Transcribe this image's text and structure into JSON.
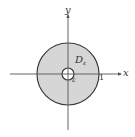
{
  "figure": {
    "type": "annulus-diagram",
    "axes": {
      "x_label": "x",
      "y_label": "y"
    },
    "region": {
      "label_main": "D",
      "label_sub": "ε",
      "fill_color": "#d6d6d6",
      "stroke_color": "#3a3a3a"
    },
    "radii": {
      "outer_label": "1",
      "inner_label": "ε"
    }
  }
}
